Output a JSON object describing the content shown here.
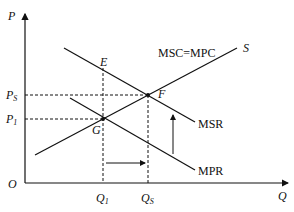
{
  "diagram": {
    "axes": {
      "y_label": "P",
      "x_label": "Q",
      "origin_label": "O"
    },
    "price_labels": {
      "ps_main": "P",
      "ps_sub": "S",
      "p1_main": "P",
      "p1_sub": "1"
    },
    "quantity_labels": {
      "q1_main": "Q",
      "q1_sub": "1",
      "qs_main": "Q",
      "qs_sub": "S"
    },
    "curves": {
      "supply_label": "S",
      "supply_name": "MSC=MPC",
      "msr": "MSR",
      "mpr": "MPR"
    },
    "points": {
      "e": "E",
      "f": "F",
      "g": "G"
    }
  }
}
